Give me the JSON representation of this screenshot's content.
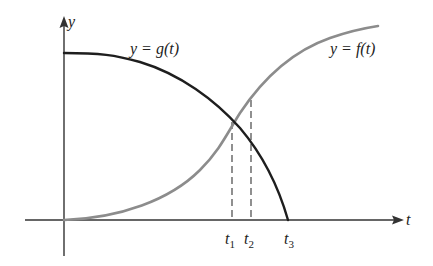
{
  "figure": {
    "type": "function-graph",
    "axes": {
      "x_label": "t",
      "y_label": "y"
    },
    "curves": [
      {
        "id": "g",
        "label_lhs": "y = g",
        "label_arg": "(t)",
        "label": "y = g(t)",
        "color": "#1e1e1e",
        "description": "decreasing, concave down, starts at positive y-intercept and hits t-axis at t3"
      },
      {
        "id": "f",
        "label_lhs": "y = f",
        "label_arg": "(t)",
        "label": "y = f(t)",
        "color": "#8c8c8c",
        "description": "increasing S-shaped curve starting at origin"
      }
    ],
    "ticks": [
      {
        "base": "t",
        "sub": "1",
        "label": "t1",
        "note": "intersection of f and g"
      },
      {
        "base": "t",
        "sub": "2",
        "label": "t2"
      },
      {
        "base": "t",
        "sub": "3",
        "label": "t3",
        "note": "zero of g"
      }
    ],
    "colors": {
      "axis": "#333333",
      "g_curve": "#1e1e1e",
      "f_curve": "#8c8c8c",
      "dashed": "#555555"
    }
  }
}
